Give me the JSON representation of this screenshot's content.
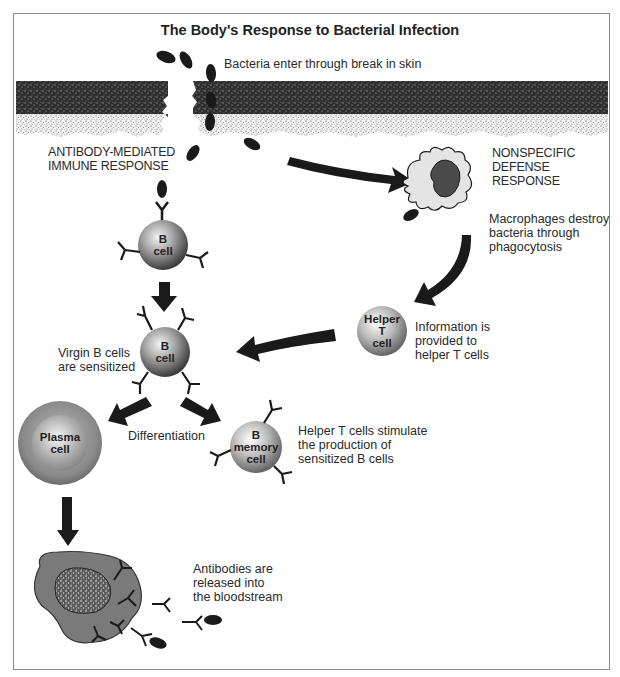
{
  "title": "The Body's Response to Bacterial Infection",
  "labels": {
    "bacteria_enter": "Bacteria enter through break in skin",
    "antibody_mediated": "ANTIBODY-MEDIATED\nIMMUNE RESPONSE",
    "nonspecific": "NONSPECIFIC\nDEFENSE\nRESPONSE",
    "macrophages": "Macrophages destroy\nbacteria through\nphagocytosis",
    "information": "Information is\nprovided to\nhelper T cells",
    "virgin": "Virgin B cells\nare sensitized",
    "differentiation": "Differentiation",
    "helper_stimulate": "Helper T cells stimulate\nthe production of\nsensitized B cells",
    "antibodies_released": "Antibodies are\nreleased into\nthe bloodstream"
  },
  "cells": {
    "b_cell_top": "B\ncell",
    "b_cell_mid": "B\ncell",
    "helper_t": "Helper\nT\ncell",
    "plasma": "Plasma\ncell",
    "b_memory": "B\nmemory\ncell"
  },
  "colors": {
    "frame": "#8a8a8a",
    "skin_dark": "#3a3a3a",
    "skin_light": "#d8d8d8",
    "arrow": "#1a1a1a",
    "cell_gray": "#8c8c8c",
    "macrophage_fill": "#e4e4e4",
    "macrophage_nucleus": "#4a4a4a",
    "plasma_body": "#7a7a7a"
  }
}
